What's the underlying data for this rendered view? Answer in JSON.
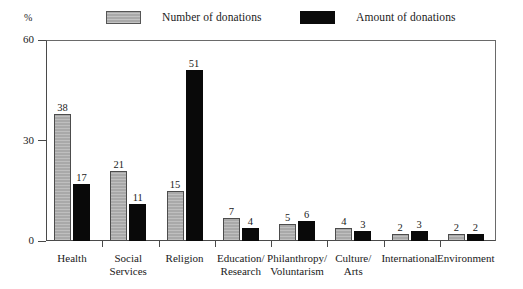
{
  "chart_data": {
    "type": "bar",
    "title": "",
    "subtitle": "",
    "xlabel": "",
    "ylabel": "%",
    "ylim": [
      0,
      60
    ],
    "yticks": [
      "0",
      "30",
      "60"
    ],
    "ytick_values": [
      0,
      30,
      60
    ],
    "grid": false,
    "legend_position": "top",
    "categories": [
      "Health",
      "Social Services",
      "Religion",
      "Education/ Research",
      "Philanthropy/ Voluntarism",
      "Culture/ Arts",
      "International",
      "Environment"
    ],
    "category_lines": [
      [
        "Health"
      ],
      [
        "Social",
        "Services"
      ],
      [
        "Religion"
      ],
      [
        "Education/",
        "Research"
      ],
      [
        "Philanthropy/",
        "Voluntarism"
      ],
      [
        "Culture/",
        "Arts"
      ],
      [
        "International"
      ],
      [
        "Environment"
      ]
    ],
    "series": [
      {
        "name": "Number of donations",
        "color": "#a9a9a9",
        "values": [
          38,
          21,
          15,
          7,
          5,
          4,
          2,
          2
        ]
      },
      {
        "name": "Amount of donations",
        "color": "#090909",
        "values": [
          17,
          11,
          51,
          4,
          6,
          3,
          3,
          2
        ]
      }
    ]
  },
  "legend": {
    "items": [
      {
        "label": "Number of donations",
        "swatch": "gray"
      },
      {
        "label": "Amount of donations",
        "swatch": "black"
      }
    ]
  },
  "axes": {
    "y_unit_label": "%",
    "y_tick_labels": [
      "60",
      "30",
      "0"
    ]
  }
}
